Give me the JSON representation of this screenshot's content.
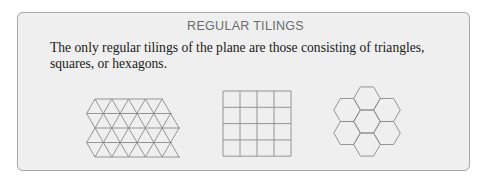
{
  "panel": {
    "title": "REGULAR TILINGS",
    "text_lines": [
      "The only regular tilings of the plane are those consisting of triangles,",
      "squares, or hexagons."
    ]
  },
  "figures": [
    {
      "name": "triangle-tiling",
      "shape": "triangle",
      "rows": 4
    },
    {
      "name": "square-tiling",
      "shape": "square",
      "rows": 4,
      "cols": 4
    },
    {
      "name": "hexagon-tiling",
      "shape": "hexagon",
      "count": 7
    }
  ],
  "colors": {
    "panel_background": "#efefef",
    "panel_border": "#a9a9a9",
    "title": "#6b6b6b",
    "text": "#1a1a1a",
    "tiling_stroke": "#8a8a8a"
  }
}
